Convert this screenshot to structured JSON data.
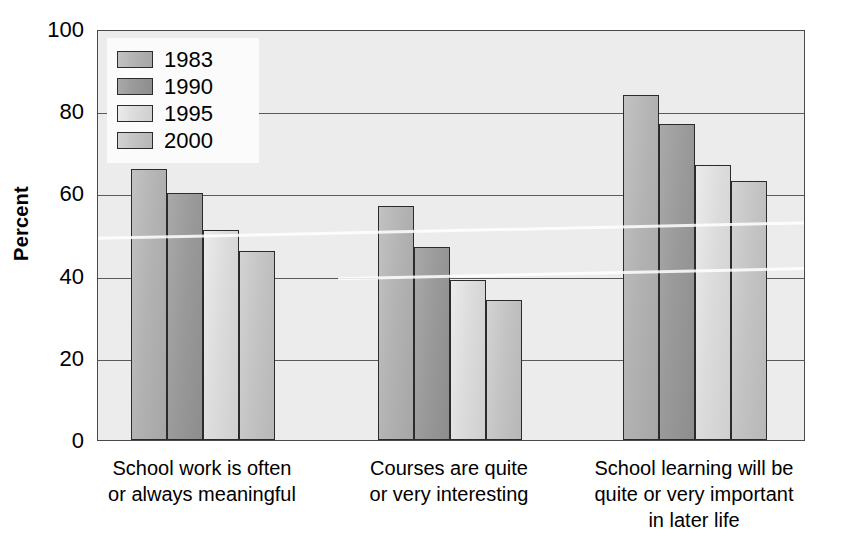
{
  "chart_data": {
    "type": "bar",
    "title": "",
    "subtitle": "",
    "xlabel": "",
    "ylabel": "Percent",
    "ylim": [
      0,
      100
    ],
    "ytick_values": [
      100,
      80,
      60,
      40,
      20,
      0
    ],
    "ytick_labels": [
      "100",
      "80",
      "60",
      "40",
      "20",
      "0"
    ],
    "grid": true,
    "legend_position": "top-left inside plot",
    "categories": [
      "School work is often\nor always meaningful",
      "Courses are quite\nor very interesting",
      "School learning will be\nquite or very important\nin later life"
    ],
    "series": [
      {
        "name": "1983",
        "color": "#b3b3b3",
        "values": [
          66,
          57,
          84
        ]
      },
      {
        "name": "1990",
        "color": "#9a9a9a",
        "values": [
          60,
          47,
          77
        ]
      },
      {
        "name": "1995",
        "color": "#dcdcdc",
        "values": [
          51,
          39,
          67
        ]
      },
      {
        "name": "2000",
        "color": "#c4c4c4",
        "values": [
          46,
          34,
          63
        ]
      }
    ]
  },
  "legend": {
    "entries": [
      {
        "label": "1983"
      },
      {
        "label": "1990"
      },
      {
        "label": "1995"
      },
      {
        "label": "2000"
      }
    ]
  },
  "axes": {
    "y_title": "Percent",
    "y_ticks": [
      {
        "label": "100"
      },
      {
        "label": "80"
      },
      {
        "label": "60"
      },
      {
        "label": "40"
      },
      {
        "label": "20"
      },
      {
        "label": "0"
      }
    ]
  },
  "colors": {
    "plot_background": "#ececec",
    "page_background": "#ffffff",
    "axis_line": "#4a4a4a",
    "gridline": "#5a5a5a",
    "bar_outline": "#2b2b2b",
    "text": "#000000"
  }
}
